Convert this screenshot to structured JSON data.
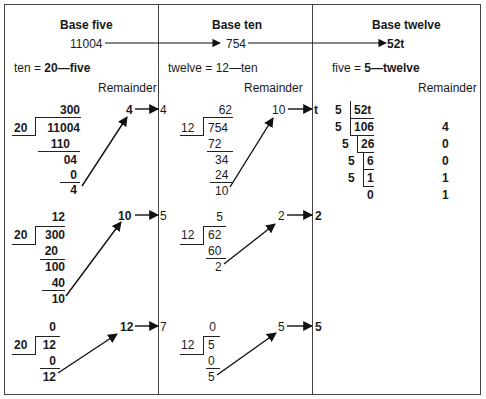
{
  "columns": [
    {
      "title": "Base five",
      "number": "11004",
      "relation_prefix": "ten = ",
      "relation_bold": "20—five",
      "remainder_label": "Remainder"
    },
    {
      "title": "Base ten",
      "number": "754",
      "relation_prefix": "twelve = 12—ten",
      "relation_bold": "",
      "remainder_label": "Remainder"
    },
    {
      "title": "Base twelve",
      "number": "52t",
      "relation_prefix": "five = ",
      "relation_bold": "5—twelve",
      "remainder_label": "Remainder"
    }
  ],
  "base_five_divisions": [
    {
      "divisor": "20",
      "quotient": "300",
      "dividend": "11004",
      "steps": [
        "110",
        "04",
        "0"
      ],
      "remainder": "4",
      "arrow_value": "4",
      "transferred": "4"
    },
    {
      "divisor": "20",
      "quotient": "12",
      "dividend": "300",
      "steps": [
        "20",
        "100",
        "40"
      ],
      "remainder": "10",
      "arrow_value": "10",
      "transferred": "5"
    },
    {
      "divisor": "20",
      "quotient": "0",
      "dividend": "12",
      "steps": [
        "0"
      ],
      "remainder": "12",
      "arrow_value": "12",
      "transferred": "7"
    }
  ],
  "base_ten_divisions": [
    {
      "divisor": "12",
      "quotient": "62",
      "dividend": "754",
      "steps": [
        "72",
        "34",
        "24"
      ],
      "remainder": "10",
      "arrow_value": "10",
      "transferred": "t"
    },
    {
      "divisor": "12",
      "quotient": "5",
      "dividend": "62",
      "steps": [
        "60"
      ],
      "remainder": "2",
      "arrow_value": "2",
      "transferred": "2"
    },
    {
      "divisor": "12",
      "quotient": "0",
      "dividend": "5",
      "steps": [
        "0"
      ],
      "remainder": "5",
      "arrow_value": "5",
      "transferred": "5"
    }
  ],
  "base_twelve_ladder": {
    "rows": [
      {
        "divisor": "5",
        "value": "52t",
        "remainder": ""
      },
      {
        "divisor": "5",
        "value": "106",
        "remainder": "4"
      },
      {
        "divisor": "5",
        "value": "26",
        "remainder": "0"
      },
      {
        "divisor": "5",
        "value": "6",
        "remainder": "0"
      },
      {
        "divisor": "5",
        "value": "1",
        "remainder": "1"
      },
      {
        "divisor": "",
        "value": "0",
        "remainder": "1"
      }
    ]
  },
  "colors": {
    "line": "#222222",
    "frame": "#444444",
    "text": "#1a1a1a"
  }
}
